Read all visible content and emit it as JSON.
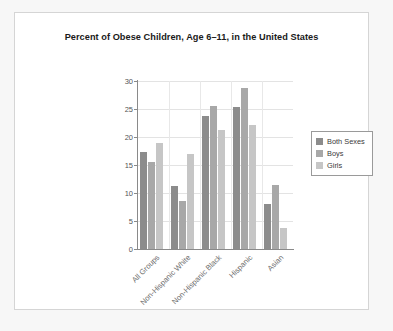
{
  "chart_data": {
    "type": "bar",
    "title": "Percent of Obese Children, Age 6–11, in the United States",
    "xlabel": "",
    "ylabel": "",
    "ylim": [
      0,
      30
    ],
    "yticks": [
      0,
      5,
      10,
      15,
      20,
      25,
      30
    ],
    "grid": true,
    "legend_position": "right",
    "categories": [
      "All Groups",
      "Non-Hispanic White",
      "Non-Hispanic Black",
      "Hispanic",
      "Asian"
    ],
    "series": [
      {
        "name": "Both Sexes",
        "color": "#8c8c8c",
        "values": [
          17.4,
          11.3,
          23.8,
          25.3,
          8.0
        ]
      },
      {
        "name": "Boys",
        "color": "#a8a8a8",
        "values": [
          15.6,
          8.6,
          25.6,
          28.7,
          11.5
        ]
      },
      {
        "name": "Girls",
        "color": "#c6c6c6",
        "values": [
          18.9,
          17.0,
          21.3,
          22.1,
          3.8
        ]
      }
    ]
  },
  "figure": {
    "background_color": "#ffffff",
    "border_color": "#d5d5d5",
    "page_background": "#f7f7f7",
    "axis_color": "#8a8a8a",
    "grid_color": "#e3e3e3"
  }
}
